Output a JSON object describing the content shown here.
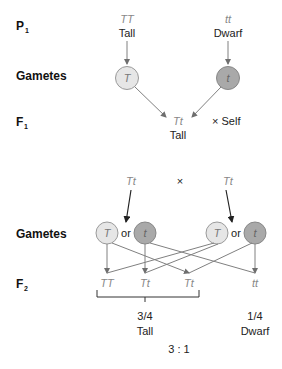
{
  "generations": {
    "p1": {
      "label": "P",
      "sub": "1"
    },
    "gametes1": {
      "label": "Gametes"
    },
    "f1": {
      "label": "F",
      "sub": "1"
    },
    "gametes2": {
      "label": "Gametes"
    },
    "f2": {
      "label": "F",
      "sub": "2"
    }
  },
  "parents": [
    {
      "genotype": "TT",
      "phenotype": "Tall"
    },
    {
      "genotype": "tt",
      "phenotype": "Dwarf"
    }
  ],
  "parent_gametes": [
    {
      "allele": "T",
      "shade": "light"
    },
    {
      "allele": "t",
      "shade": "dark"
    }
  ],
  "f1": {
    "genotype": "Tt",
    "phenotype": "Tall",
    "cross_label": "× Self"
  },
  "f1_cross": {
    "left": "Tt",
    "symbol": "×",
    "right": "Tt"
  },
  "f1_gametes": {
    "left": [
      {
        "allele": "T",
        "shade": "light"
      },
      {
        "allele": "t",
        "shade": "dark"
      }
    ],
    "right": [
      {
        "allele": "T",
        "shade": "light"
      },
      {
        "allele": "t",
        "shade": "dark"
      }
    ],
    "connector": "or"
  },
  "f2": {
    "genotypes": [
      "TT",
      "Tt",
      "Tt",
      "tt"
    ],
    "groups": [
      {
        "fraction": "3/4",
        "phenotype": "Tall"
      },
      {
        "fraction": "1/4",
        "phenotype": "Dwarf"
      }
    ],
    "ratio": "3 : 1"
  },
  "colors": {
    "light_gamete": "#e6e6e6",
    "dark_gamete": "#a9a9a9",
    "line": "#808080",
    "arrow_dark": "#222222"
  }
}
